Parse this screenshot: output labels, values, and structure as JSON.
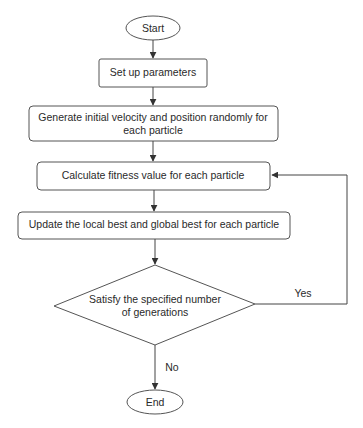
{
  "flowchart": {
    "nodes": {
      "start": {
        "type": "terminal",
        "label": "Start"
      },
      "setup": {
        "type": "process",
        "label": "Set up parameters"
      },
      "generate": {
        "type": "process",
        "line1": "Generate initial velocity and position randomly for",
        "line2": "each particle"
      },
      "calculate": {
        "type": "process",
        "label": "Calculate fitness value for each particle"
      },
      "update": {
        "type": "process",
        "label": "Update the local best and global best for each particle"
      },
      "decision": {
        "type": "decision",
        "line1": "Satisfy the specified number",
        "line2": "of generations"
      },
      "end": {
        "type": "terminal",
        "label": "End"
      }
    },
    "edges": {
      "yes_label": "Yes",
      "no_label": "No"
    },
    "colors": {
      "stroke": "#555555",
      "text": "#2a2a2a",
      "background": "#ffffff"
    }
  }
}
